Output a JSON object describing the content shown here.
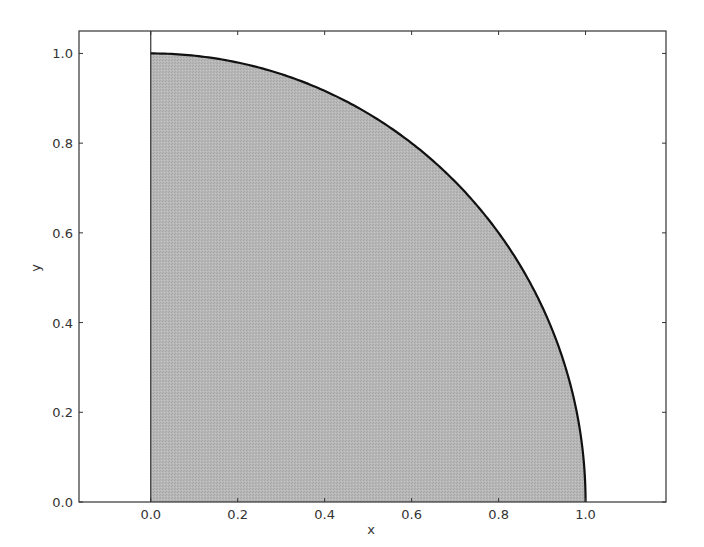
{
  "chart_data": {
    "type": "area",
    "title": "",
    "xlabel": "x",
    "ylabel": "y",
    "xlim": [
      -0.165,
      1.185
    ],
    "ylim": [
      0.0,
      1.05
    ],
    "xticks": [
      0.0,
      0.2,
      0.4,
      0.6,
      0.8,
      1.0
    ],
    "xtick_labels": [
      "0.0",
      "0.2",
      "0.4",
      "0.6",
      "0.8",
      "1.0"
    ],
    "yticks": [
      0.0,
      0.2,
      0.4,
      0.6,
      0.8,
      1.0
    ],
    "ytick_labels": [
      "0.0",
      "0.2",
      "0.4",
      "0.6",
      "0.8",
      "1.0"
    ],
    "grid": false,
    "legend": null,
    "series": [
      {
        "name": "quarter circle y = sqrt(1 - x^2)",
        "kind": "line",
        "color": "#111111",
        "x": [
          0.0,
          0.1,
          0.2,
          0.3,
          0.4,
          0.5,
          0.6,
          0.7,
          0.8,
          0.9,
          0.95,
          1.0
        ],
        "y": [
          1.0,
          0.995,
          0.98,
          0.954,
          0.917,
          0.866,
          0.8,
          0.714,
          0.6,
          0.436,
          0.312,
          0.0
        ]
      },
      {
        "name": "filled area under curve",
        "kind": "fill",
        "color": "#b4b4b4",
        "x_range": [
          0.0,
          1.0
        ]
      }
    ],
    "annotations": [
      {
        "type": "vertical-line",
        "x": 0.0,
        "color": "#333333"
      }
    ]
  },
  "labels": {
    "xlabel": "x",
    "ylabel": "y"
  }
}
